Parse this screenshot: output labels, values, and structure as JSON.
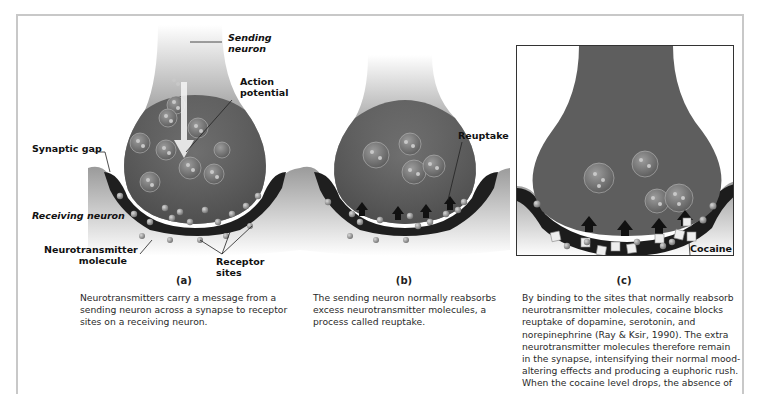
{
  "figure": {
    "panels": [
      {
        "id": "a",
        "letter": "(a)",
        "labels": {
          "sending_neuron": [
            "Sending",
            "neuron"
          ],
          "action_potential": [
            "Action",
            "potential"
          ],
          "synaptic_gap": "Synaptic gap",
          "receiving_neuron": "Receiving neuron",
          "neurotransmitter_molecule": [
            "Neurotransmitter",
            "molecule"
          ],
          "receptor_sites": [
            "Receptor",
            "sites"
          ]
        },
        "caption": [
          "Neurotransmitters carry a message from a",
          "sending neuron across a synapse to receptor",
          "sites on a receiving neuron."
        ]
      },
      {
        "id": "b",
        "letter": "(b)",
        "labels": {
          "reuptake": "Reuptake"
        },
        "caption": [
          "The sending neuron normally reabsorbs",
          "excess neurotransmitter molecules, a",
          "process called reuptake."
        ]
      },
      {
        "id": "c",
        "letter": "(c)",
        "labels": {
          "cocaine": "Cocaine"
        },
        "caption": [
          "By binding to the sites that normally reabsorb",
          "neurotransmitter molecules, cocaine blocks",
          "reuptake of dopamine, serotonin, and",
          "norepinephrine (Ray & Ksir, 1990). The extra",
          "neurotransmitter molecules therefore remain",
          "in the synapse, intensifying their normal mood-",
          "altering effects and producing a euphoric rush.",
          "When the cocaine level drops, the absence of"
        ]
      }
    ],
    "colors": {
      "frame": "#c8c8c8",
      "neuron_dark": "#3a3a3a",
      "neuron_mid": "#6e6e6e",
      "gap": "#1c1c1c",
      "text": "#1a1a1a"
    }
  }
}
